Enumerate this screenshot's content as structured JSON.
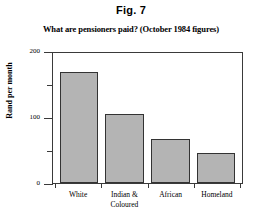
{
  "figure": {
    "label": "Fig. 7"
  },
  "chart_data": {
    "type": "bar",
    "title": "What are pensioners paid? (October 1984 figures)",
    "xlabel": "",
    "ylabel": "Rand per month",
    "categories": [
      "White",
      "Indian & Coloured",
      "African",
      "Homeland"
    ],
    "category_lines": [
      [
        "White"
      ],
      [
        "Indian &",
        "Coloured"
      ],
      [
        "African"
      ],
      [
        "Homeland"
      ]
    ],
    "values": [
      168,
      105,
      67,
      45
    ],
    "ylim": [
      0,
      200
    ],
    "yticks_major": [
      0,
      100,
      200
    ],
    "yticks_minor": [
      50,
      150
    ],
    "ytick_labels": [
      "0",
      "100",
      "200"
    ],
    "grid": false,
    "legend": "none",
    "bar_color": "#b4b4b4",
    "bar_edge_color": "#333333",
    "axis_color": "#3a3a3a",
    "background": "#ffffff"
  }
}
